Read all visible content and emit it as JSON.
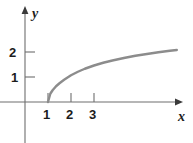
{
  "figure": {
    "name": "logarithmic-curve-plot",
    "width": 193,
    "height": 143,
    "background": "#ffffff"
  },
  "axes": {
    "x_axis": {
      "label": "x",
      "color": "#6e6e6e",
      "arrow": "right",
      "tick_labels": [
        "1",
        "2",
        "3"
      ],
      "tick_values": [
        1,
        2,
        3
      ],
      "origin_px": 25,
      "unit_px": 23,
      "range_shown": [
        -1.09,
        6.74
      ]
    },
    "y_axis": {
      "label": "y",
      "color": "#6e6e6e",
      "arrow": "up",
      "tick_labels": [
        "1",
        "2"
      ],
      "tick_values": [
        1,
        2
      ],
      "origin_px": 102,
      "unit_px": 25,
      "range_shown": [
        -1.64,
        3.76
      ]
    }
  },
  "ticks": {
    "y_tick_2": "2",
    "y_tick_1": "1",
    "x_tick_1": "1",
    "x_tick_2": "2",
    "x_tick_3": "3"
  },
  "labels": {
    "x": "x",
    "y": "y"
  },
  "chart_data": {
    "type": "line",
    "title": "",
    "xlabel": "x",
    "ylabel": "y",
    "xlim": [
      -1.09,
      6.74
    ],
    "ylim": [
      -1.64,
      3.76
    ],
    "xticks": [
      1,
      2,
      3
    ],
    "yticks": [
      1,
      2
    ],
    "grid": false,
    "legend": null,
    "annotations": [],
    "series": [
      {
        "name": "y = log(x) curve",
        "color": "#8c8c8c",
        "linewidth": 2.4,
        "description": "Increasing concave-down curve beginning at (1, 0) with a vertical tangent and flattening toward the right; logarithm-shaped.",
        "x": [
          1.0,
          1.1,
          1.2,
          1.35,
          1.5,
          1.7,
          2.0,
          2.3,
          2.6,
          3.0,
          3.4,
          3.8,
          4.3,
          4.8,
          5.3,
          5.8,
          6.3,
          6.6
        ],
        "y": [
          0.0,
          0.33,
          0.47,
          0.63,
          0.75,
          0.89,
          1.07,
          1.21,
          1.33,
          1.46,
          1.57,
          1.66,
          1.76,
          1.85,
          1.92,
          1.99,
          2.05,
          2.08
        ]
      }
    ]
  }
}
